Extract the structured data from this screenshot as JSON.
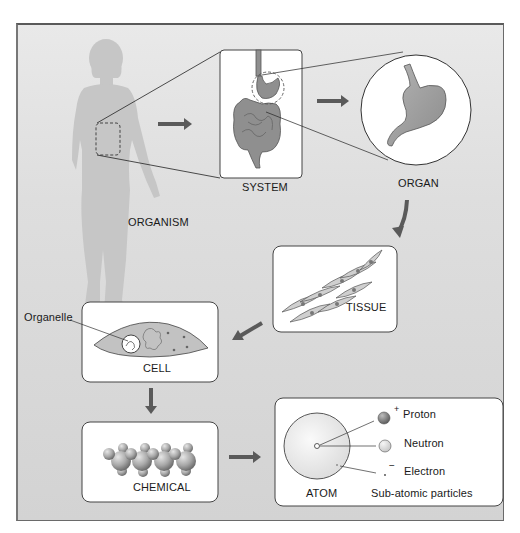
{
  "diagram": {
    "colors": {
      "background_top": "#e9e9e9",
      "background_bottom": "#d3d3d3",
      "silhouette": "#c4c4c4",
      "organ_fill": "#9a9a9a",
      "arrow": "#555555",
      "box_fill": "#ffffff",
      "box_border": "#333333"
    },
    "levels": [
      {
        "id": "organism",
        "label": "ORGANISM"
      },
      {
        "id": "system",
        "label": "SYSTEM"
      },
      {
        "id": "organ",
        "label": "ORGAN"
      },
      {
        "id": "tissue",
        "label": "TISSUE"
      },
      {
        "id": "cell",
        "label": "CELL",
        "callout": "Organelle"
      },
      {
        "id": "chemical",
        "label": "CHEMICAL"
      },
      {
        "id": "atom",
        "label": "ATOM"
      }
    ],
    "subatomic": {
      "caption": "Sub-atomic particles",
      "particles": [
        {
          "name": "Proton",
          "charge": "+"
        },
        {
          "name": "Neutron",
          "charge": ""
        },
        {
          "name": "Electron",
          "charge": "−"
        }
      ]
    },
    "flow": [
      "ORGANISM",
      "SYSTEM",
      "ORGAN",
      "TISSUE",
      "CELL",
      "CHEMICAL",
      "ATOM"
    ]
  }
}
